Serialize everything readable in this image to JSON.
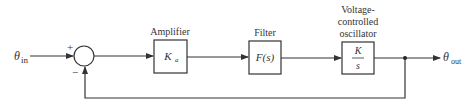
{
  "diagram": {
    "type": "block-diagram",
    "input": {
      "symbol": "θ",
      "subscript": "in"
    },
    "output": {
      "symbol": "θ",
      "subscript": "out"
    },
    "summing_junction": {
      "plus_sign": "+",
      "minus_sign": "−"
    },
    "blocks": [
      {
        "id": "amplifier",
        "label_lines": [
          "Amplifier"
        ],
        "transfer": {
          "main": "K",
          "sub": "a"
        }
      },
      {
        "id": "filter",
        "label_lines": [
          "Filter"
        ],
        "transfer": {
          "main": "F(s)"
        }
      },
      {
        "id": "vco",
        "label_lines": [
          "Voltage-",
          "controlled",
          "oscillator"
        ],
        "transfer": {
          "num": "K",
          "den": "s"
        }
      }
    ],
    "feedback": "unity negative feedback from output to summing junction",
    "colors": {
      "line": "#333333",
      "background": "#ffffff"
    }
  }
}
